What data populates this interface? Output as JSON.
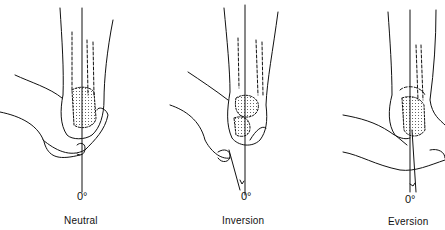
{
  "figure": {
    "panels": [
      {
        "id": "neutral",
        "angle_label": "0°",
        "caption": "Neutral"
      },
      {
        "id": "inversion",
        "angle_label": "0°",
        "caption": "Inversion"
      },
      {
        "id": "eversion",
        "angle_label": "0°",
        "caption": "Eversion"
      }
    ]
  }
}
